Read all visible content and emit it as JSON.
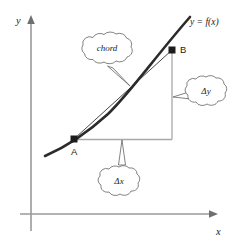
{
  "figure": {
    "background_color": "#ffffff",
    "width": 241,
    "height": 243
  },
  "axes": {
    "y_label": "y",
    "x_label": "x",
    "axis_color": "#9a9a9a",
    "arrowhead_color": "#6f6f6f"
  },
  "curve": {
    "label": "y = f(x)",
    "color": "#2b2b2b"
  },
  "chord": {
    "color": "#4a4a4a"
  },
  "points": [
    {
      "name": "A",
      "label": "A"
    },
    {
      "name": "B",
      "label": "B"
    }
  ],
  "construction_lines": {
    "color": "#a8a8a8"
  },
  "callouts": [
    {
      "name": "chord",
      "label": "chord"
    },
    {
      "name": "delta-y",
      "label": "Δy"
    },
    {
      "name": "delta-x",
      "label": "Δx"
    }
  ]
}
